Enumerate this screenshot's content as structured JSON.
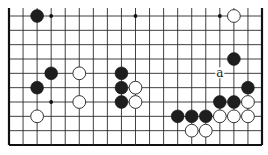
{
  "board": {
    "columns": 19,
    "rows": 10,
    "open_edges": [
      "top"
    ],
    "colors": {
      "black": "#1e1e1e",
      "white": "#ffffff",
      "line": "#2a2a2a"
    }
  },
  "star_points": [
    {
      "col": 3,
      "row": 0
    },
    {
      "col": 9,
      "row": 0
    },
    {
      "col": 15,
      "row": 0
    },
    {
      "col": 3,
      "row": 6
    }
  ],
  "stones": [
    {
      "color": "black",
      "col": 2,
      "row": 0
    },
    {
      "color": "white",
      "col": 16,
      "row": 0
    },
    {
      "color": "black",
      "col": 16,
      "row": 3
    },
    {
      "color": "black",
      "col": 3,
      "row": 4
    },
    {
      "color": "white",
      "col": 5,
      "row": 4
    },
    {
      "color": "black",
      "col": 8,
      "row": 4
    },
    {
      "color": "black",
      "col": 2,
      "row": 5
    },
    {
      "color": "black",
      "col": 8,
      "row": 5
    },
    {
      "color": "white",
      "col": 9,
      "row": 5
    },
    {
      "color": "black",
      "col": 17,
      "row": 5
    },
    {
      "color": "white",
      "col": 5,
      "row": 6
    },
    {
      "color": "black",
      "col": 8,
      "row": 6
    },
    {
      "color": "white",
      "col": 9,
      "row": 6
    },
    {
      "color": "black",
      "col": 15,
      "row": 6
    },
    {
      "color": "black",
      "col": 16,
      "row": 6
    },
    {
      "color": "white",
      "col": 17,
      "row": 6
    },
    {
      "color": "white",
      "col": 2,
      "row": 7
    },
    {
      "color": "black",
      "col": 12,
      "row": 7
    },
    {
      "color": "black",
      "col": 13,
      "row": 7
    },
    {
      "color": "black",
      "col": 14,
      "row": 7
    },
    {
      "color": "white",
      "col": 15,
      "row": 7
    },
    {
      "color": "white",
      "col": 16,
      "row": 7
    },
    {
      "color": "white",
      "col": 17,
      "row": 7
    },
    {
      "color": "white",
      "col": 13,
      "row": 8
    },
    {
      "color": "white",
      "col": 14,
      "row": 8
    }
  ],
  "labels": [
    {
      "text": "a",
      "col": 15,
      "row": 4
    }
  ]
}
